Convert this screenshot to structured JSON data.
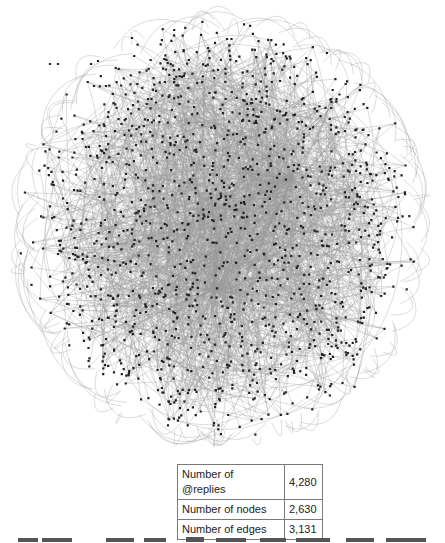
{
  "figure": {
    "node_color": "#222222",
    "edge_color": "#9a9a9a"
  },
  "stats_table": {
    "rows": [
      {
        "label": "Number of @replies",
        "value": "4,280"
      },
      {
        "label": "Number of nodes",
        "value": "2,630"
      },
      {
        "label": "Number of edges",
        "value": "3,131"
      }
    ]
  }
}
